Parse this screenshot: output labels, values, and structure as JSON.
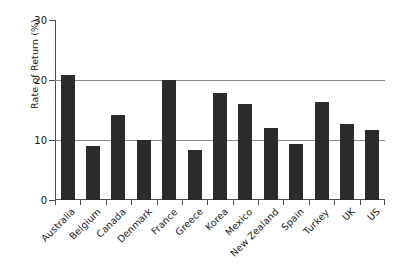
{
  "chart_data": {
    "type": "bar",
    "title": "",
    "xlabel": "",
    "ylabel": "Rate of Return (%)",
    "ylim": [
      0,
      30
    ],
    "yticks": [
      0,
      10,
      20,
      30
    ],
    "gridlines": [
      10,
      20
    ],
    "grid": true,
    "legend": "none",
    "bar_color": "#2b2b2b",
    "categories": [
      "Australia",
      "Belgium",
      "Canada",
      "Denmark",
      "France",
      "Greece",
      "Korea",
      "Mexico",
      "New Zealand",
      "Spain",
      "Turkey",
      "UK",
      "US"
    ],
    "values": [
      20.8,
      9.0,
      14.1,
      10.0,
      20.0,
      8.3,
      17.9,
      16.0,
      12.0,
      9.4,
      16.3,
      12.6,
      11.6
    ]
  },
  "axis": {
    "y_tick_labels": [
      "0",
      "10",
      "20",
      "30"
    ],
    "y_title": "Rate of Return (%)"
  },
  "colors": {
    "bar": "#2b2b2b",
    "grid": "#8a8a8a",
    "axis": "#4d4d4d",
    "background": "#ffffff",
    "text": "#1a1a1a"
  }
}
